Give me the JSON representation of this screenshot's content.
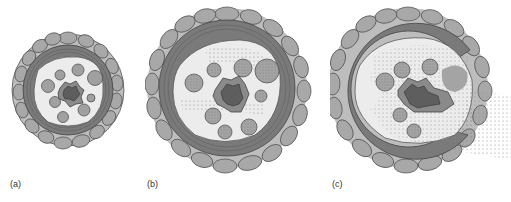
{
  "figure": {
    "panels": [
      {
        "id": "a",
        "label": "(a)",
        "stage": "healthy cross-section"
      },
      {
        "id": "b",
        "label": "(b)",
        "stage": "early colonization"
      },
      {
        "id": "c",
        "label": "(c)",
        "stage": "ruptured cortex"
      }
    ],
    "colors": {
      "epidermis_cell": "#a8a8a8",
      "epidermis_outline": "#555555",
      "cortex_band": "#7a7a7a",
      "cortex_band_dark": "#666666",
      "stele_interior": "#ececec",
      "vessel": "#a0a0a0",
      "pith_outer": "#8a8a8a",
      "pith_inner": "#5e5e5e",
      "stipple": "#9a9a9a"
    }
  }
}
